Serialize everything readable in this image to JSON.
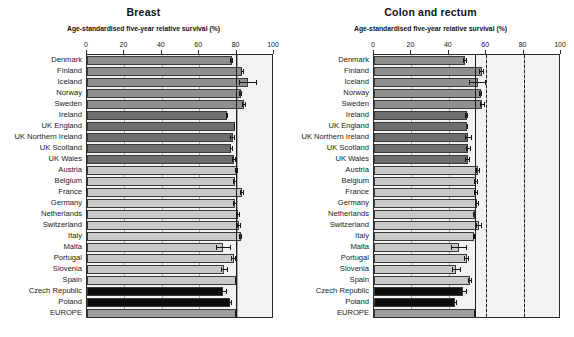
{
  "figure": {
    "background_color": "#ffffff",
    "plot_background_color": "#f2f2f0"
  },
  "series_colors": {
    "nordic": "#8f8f8f",
    "uk_ireland": "#6e6e6e",
    "central_southern": "#c9c9c7",
    "eastern": "#0d0d0d",
    "europe": "#9e9e9e"
  },
  "panels": [
    {
      "id": "breast",
      "title": "Breast",
      "axis_title": "Age-standardised five-year relative survival (%)"
    },
    {
      "id": "colon-and-rectum",
      "title": "Colon and rectum",
      "axis_title": "Age-standardised five-year relative survival (%)"
    }
  ],
  "countries": [
    "Denmark",
    "Finland",
    "Iceland",
    "Norway",
    "Sweden",
    "Ireland",
    "UK England",
    "UK Northern Ireland",
    "UK Scotland",
    "UK Wales",
    "Austria",
    "Belgium",
    "France",
    "Germany",
    "Netherlands",
    "Switzerland",
    "Italy",
    "Malta",
    "Portugal",
    "Slovenia",
    "Spain",
    "Czech Republic",
    "Poland",
    "EUROPE"
  ],
  "chart_data": [
    {
      "type": "bar",
      "id": "breast",
      "title": "Breast",
      "xlabel": "Age-standardised five-year relative survival (%)",
      "ylabel": "",
      "orientation": "horizontal",
      "xlim": [
        0,
        100
      ],
      "xticks": [
        0,
        20,
        40,
        60,
        80,
        100
      ],
      "grid": true,
      "legend": "none",
      "reference_lines": [
        {
          "value": 79.5,
          "style": "solid",
          "label": "EUROPE mean"
        }
      ],
      "categories": [
        "Denmark",
        "Finland",
        "Iceland",
        "Norway",
        "Sweden",
        "Ireland",
        "UK England",
        "UK Northern Ireland",
        "UK Scotland",
        "UK Wales",
        "Austria",
        "Belgium",
        "France",
        "Germany",
        "Netherlands",
        "Switzerland",
        "Italy",
        "Malta",
        "Portugal",
        "Slovenia",
        "Spain",
        "Czech Republic",
        "Poland",
        "EUROPE"
      ],
      "values": [
        77.3,
        83.1,
        86.0,
        82.1,
        84.0,
        74.9,
        79.0,
        78.0,
        77.1,
        78.6,
        80.0,
        79.2,
        83.0,
        79.1,
        81.0,
        81.3,
        82.1,
        72.9,
        78.4,
        73.4,
        79.5,
        72.9,
        76.7,
        79.5
      ],
      "errors_low": [
        76.7,
        82.1,
        81.2,
        81.4,
        83.1,
        74.2,
        78.7,
        76.6,
        76.3,
        77.6,
        79.3,
        78.2,
        81.9,
        78.2,
        80.2,
        80.0,
        81.5,
        68.9,
        77.2,
        71.6,
        78.9,
        70.9,
        75.7,
        79.3
      ],
      "errors_high": [
        77.9,
        84.1,
        91.1,
        82.8,
        85.0,
        75.6,
        79.3,
        79.4,
        77.9,
        79.6,
        80.7,
        80.2,
        84.2,
        80.1,
        81.8,
        82.6,
        82.7,
        76.9,
        79.6,
        75.2,
        80.1,
        74.9,
        77.7,
        79.7
      ],
      "group_map": [
        "nordic",
        "nordic",
        "nordic",
        "nordic",
        "nordic",
        "uk_ireland",
        "uk_ireland",
        "uk_ireland",
        "uk_ireland",
        "uk_ireland",
        "central_southern",
        "central_southern",
        "central_southern",
        "central_southern",
        "central_southern",
        "central_southern",
        "central_southern",
        "central_southern",
        "central_southern",
        "central_southern",
        "central_southern",
        "eastern",
        "eastern",
        "europe"
      ]
    },
    {
      "type": "bar",
      "id": "colon-and-rectum",
      "title": "Colon and rectum",
      "xlabel": "Age-standardised five-year relative survival (%)",
      "ylabel": "",
      "orientation": "horizontal",
      "xlim": [
        0,
        100
      ],
      "xticks": [
        0,
        20,
        40,
        60,
        80,
        100
      ],
      "grid": true,
      "legend": "none",
      "reference_lines": [
        {
          "value": 54.0,
          "style": "solid",
          "label": "EUROPE mean"
        },
        {
          "value": 60.0,
          "style": "dashed",
          "label": ""
        },
        {
          "value": 80.0,
          "style": "dashed",
          "label": ""
        }
      ],
      "categories": [
        "Denmark",
        "Finland",
        "Iceland",
        "Norway",
        "Sweden",
        "Ireland",
        "UK England",
        "UK Northern Ireland",
        "UK Scotland",
        "UK Wales",
        "Austria",
        "Belgium",
        "France",
        "Germany",
        "Netherlands",
        "Switzerland",
        "Italy",
        "Malta",
        "Portugal",
        "Slovenia",
        "Spain",
        "Czech Republic",
        "Poland",
        "EUROPE"
      ],
      "values": [
        48.5,
        57.5,
        55.5,
        57.0,
        58.0,
        49.5,
        49.8,
        50.5,
        50.5,
        50.0,
        55.5,
        54.5,
        54.5,
        55.0,
        54.0,
        56.0,
        53.5,
        45.5,
        49.5,
        44.0,
        51.5,
        47.5,
        43.5,
        54.0
      ],
      "errors_low": [
        47.5,
        56.2,
        51.0,
        56.0,
        56.9,
        48.5,
        49.5,
        48.5,
        49.3,
        48.8,
        54.3,
        53.5,
        53.5,
        54.0,
        53.2,
        54.5,
        53.0,
        41.0,
        48.2,
        41.5,
        50.5,
        45.5,
        42.5,
        53.7
      ],
      "errors_high": [
        49.5,
        58.8,
        60.0,
        58.0,
        59.1,
        50.5,
        50.1,
        52.5,
        51.7,
        51.2,
        56.7,
        55.5,
        55.5,
        56.0,
        54.8,
        57.5,
        54.0,
        50.0,
        50.8,
        46.5,
        52.5,
        49.5,
        44.5,
        54.3
      ],
      "group_map": [
        "nordic",
        "nordic",
        "nordic",
        "nordic",
        "nordic",
        "uk_ireland",
        "uk_ireland",
        "uk_ireland",
        "uk_ireland",
        "uk_ireland",
        "central_southern",
        "central_southern",
        "central_southern",
        "central_southern",
        "central_southern",
        "central_southern",
        "central_southern",
        "central_southern",
        "central_southern",
        "central_southern",
        "central_southern",
        "eastern",
        "eastern",
        "europe"
      ]
    }
  ]
}
